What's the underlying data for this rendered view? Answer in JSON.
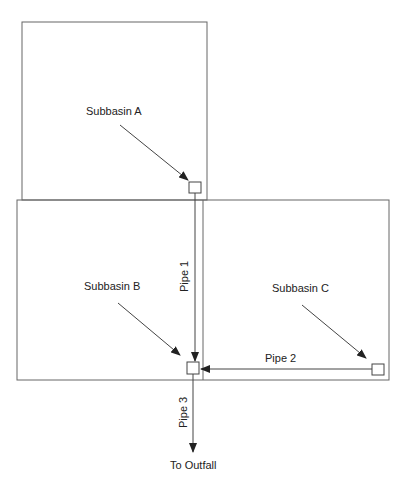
{
  "diagram": {
    "title": "",
    "colors": {
      "line": "#555555",
      "arrow": "#222222",
      "text": "#222222",
      "node_fill": "#ffffff"
    },
    "subbasins": [
      {
        "id": "A",
        "label": "Subbasin A"
      },
      {
        "id": "B",
        "label": "Subbasin B"
      },
      {
        "id": "C",
        "label": "Subbasin C"
      }
    ],
    "pipes": [
      {
        "id": "1",
        "label": "Pipe 1",
        "from": "A",
        "to": "B"
      },
      {
        "id": "2",
        "label": "Pipe 2",
        "from": "C",
        "to": "B"
      },
      {
        "id": "3",
        "label": "Pipe 3",
        "from": "B",
        "to": "Outfall"
      }
    ],
    "outfall": {
      "label": "To Outfall"
    }
  }
}
